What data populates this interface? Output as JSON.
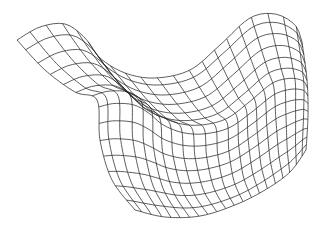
{
  "figure": {
    "width": 319,
    "height": 228,
    "background": "#ffffff",
    "line_color": "#2a2a2a",
    "line_width": 0.75
  },
  "mesh": {
    "u_lines": 22,
    "v_lines": 15,
    "samples": 60,
    "corners": {
      "top_left": [
        17,
        40
      ],
      "top_right": [
        302,
        42
      ],
      "bottom_left": [
        135,
        210
      ],
      "bottom_right": [
        306,
        150
      ]
    },
    "edges": {
      "top": [
        [
          17,
          40
        ],
        [
          40,
          27
        ],
        [
          65,
          24
        ],
        [
          85,
          38
        ],
        [
          100,
          58
        ],
        [
          125,
          73
        ],
        [
          155,
          78
        ],
        [
          190,
          70
        ],
        [
          220,
          45
        ],
        [
          250,
          18
        ],
        [
          275,
          14
        ],
        [
          295,
          25
        ],
        [
          302,
          42
        ]
      ],
      "bottom": [
        [
          135,
          210
        ],
        [
          165,
          217
        ],
        [
          200,
          216
        ],
        [
          235,
          205
        ],
        [
          265,
          190
        ],
        [
          290,
          172
        ],
        [
          306,
          150
        ]
      ],
      "left": [
        [
          17,
          40
        ],
        [
          45,
          70
        ],
        [
          75,
          92
        ],
        [
          97,
          100
        ],
        [
          100,
          140
        ],
        [
          112,
          180
        ],
        [
          135,
          210
        ]
      ],
      "right": [
        [
          302,
          42
        ],
        [
          307,
          80
        ],
        [
          308,
          115
        ],
        [
          306,
          150
        ]
      ]
    }
  }
}
